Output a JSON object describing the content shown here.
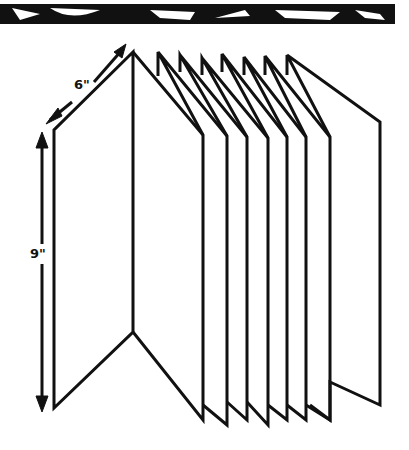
{
  "diagram": {
    "dimensions": {
      "width_label": "6\"",
      "height_label": "9\""
    },
    "panel_count": 10,
    "colors": {
      "stroke": "#111111",
      "background": "#ffffff"
    }
  }
}
